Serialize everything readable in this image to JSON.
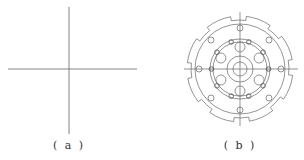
{
  "figures": [
    {
      "id": "a",
      "label": "( a )",
      "description": "Crosshair centerlines"
    },
    {
      "id": "b",
      "label": "( b )",
      "description": "Circular gear-like part with bolt circle and hub"
    }
  ],
  "colors": {
    "line": "#555555",
    "background": "#ffffff"
  }
}
